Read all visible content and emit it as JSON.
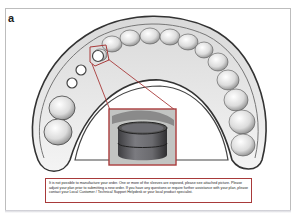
{
  "figure": {
    "panel_label": "a",
    "highlight_color": "#a83a3a",
    "zoom_inset": {
      "description": "magnified view of exposed sleeve",
      "source_region": "left posterior sleeve"
    },
    "notice": {
      "text": "It is not possible to manufacture your order. One or more of the sleeves are exposed, please see attached picture.  Please adjust your plan prior to submitting a new order.  If you have any questions or require further assistance with your plan, please contact your Local Customer / Technical Support Helpdesk or your local product specialist."
    }
  }
}
